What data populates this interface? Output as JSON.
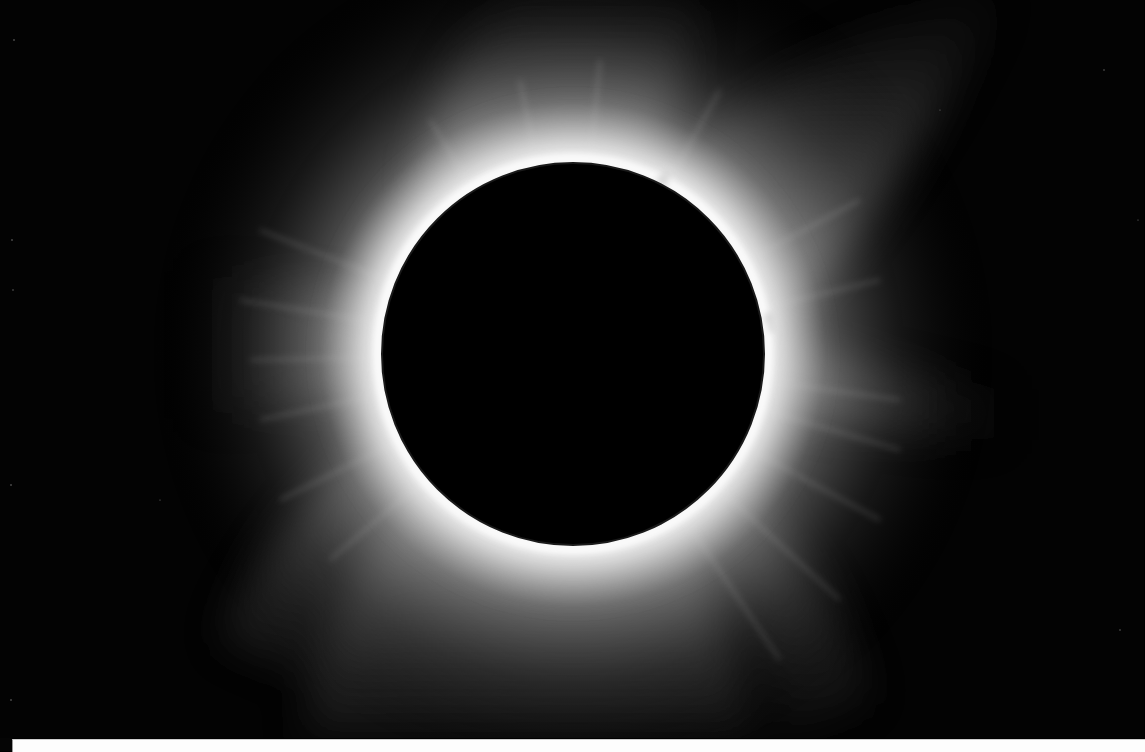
{
  "image": {
    "subject": "total solar eclipse corona",
    "palette": {
      "sky": "#030303",
      "moon": "#000000",
      "corona_inner": "#f2f2f2",
      "corona_mid": "#9a9a9a",
      "corona_outer": "#3a3a3a",
      "strip": "#fdfdfd"
    },
    "moon": {
      "cx": 573,
      "cy": 354,
      "r": 191
    },
    "prominences": [
      {
        "cx": 663,
        "cy": 180
      },
      {
        "cx": 770,
        "cy": 318
      }
    ]
  }
}
